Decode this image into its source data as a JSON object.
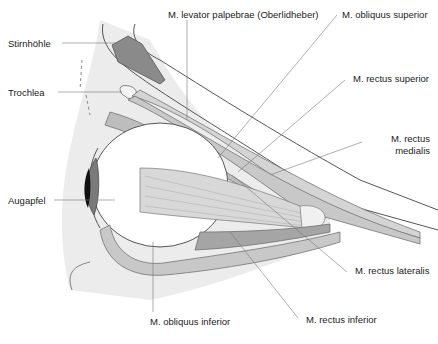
{
  "figure": {
    "labels": {
      "stirnhoehle": "Stirnhöhle",
      "trochlea": "Trochlea",
      "augapfel": "Augapfel",
      "levator": "M. levator palpebrae (Oberlidheber)",
      "obliquus_superior": "M. obliquus superior",
      "rectus_superior": "M. rectus superior",
      "rectus_medialis_1": "M. rectus",
      "rectus_medialis_2": "medialis",
      "rectus_lateralis": "M. rectus lateralis",
      "rectus_inferior": "M. rectus inferior",
      "obliquus_inferior": "M. obliquus inferior"
    },
    "colors": {
      "background": "#ffffff",
      "skin_shade": "#e9e9e9",
      "muscle": "#cfcfcf",
      "muscle_dark": "#9a9a9a",
      "sinus": "#8a8a8a",
      "outline": "#555555",
      "leader_line": "#777777",
      "iris": "#7a7a7a",
      "pupil": "#111111"
    }
  }
}
